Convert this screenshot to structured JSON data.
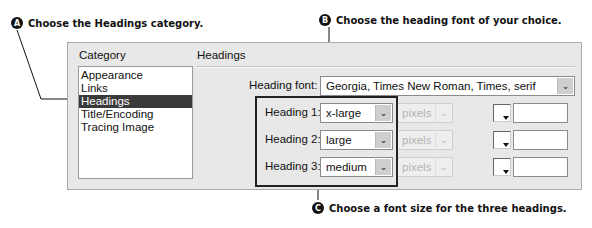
{
  "callouts": {
    "a": {
      "badge": "A",
      "text": "Choose the Headings category."
    },
    "b": {
      "badge": "B",
      "text": "Choose the heading font of your choice."
    },
    "c": {
      "badge": "C",
      "text": "Choose a font size for the three headings."
    }
  },
  "dialog": {
    "category_label": "Category",
    "section_title": "Headings",
    "categories": [
      {
        "label": "Appearance",
        "selected": false
      },
      {
        "label": "Links",
        "selected": false
      },
      {
        "label": "Headings",
        "selected": true
      },
      {
        "label": "Title/Encoding",
        "selected": false
      },
      {
        "label": "Tracing Image",
        "selected": false
      }
    ],
    "heading_font": {
      "label": "Heading font:",
      "value": "Georgia, Times New Roman, Times, serif"
    },
    "headings": [
      {
        "label": "Heading 1:",
        "size": "x-large",
        "unit": "pixels",
        "color": ""
      },
      {
        "label": "Heading 2:",
        "size": "large",
        "unit": "pixels",
        "color": ""
      },
      {
        "label": "Heading 3:",
        "size": "medium",
        "unit": "pixels",
        "color": ""
      }
    ],
    "icons": {
      "dropdown": "chevron-down-icon",
      "color_picker": "color-swatch-icon"
    }
  }
}
